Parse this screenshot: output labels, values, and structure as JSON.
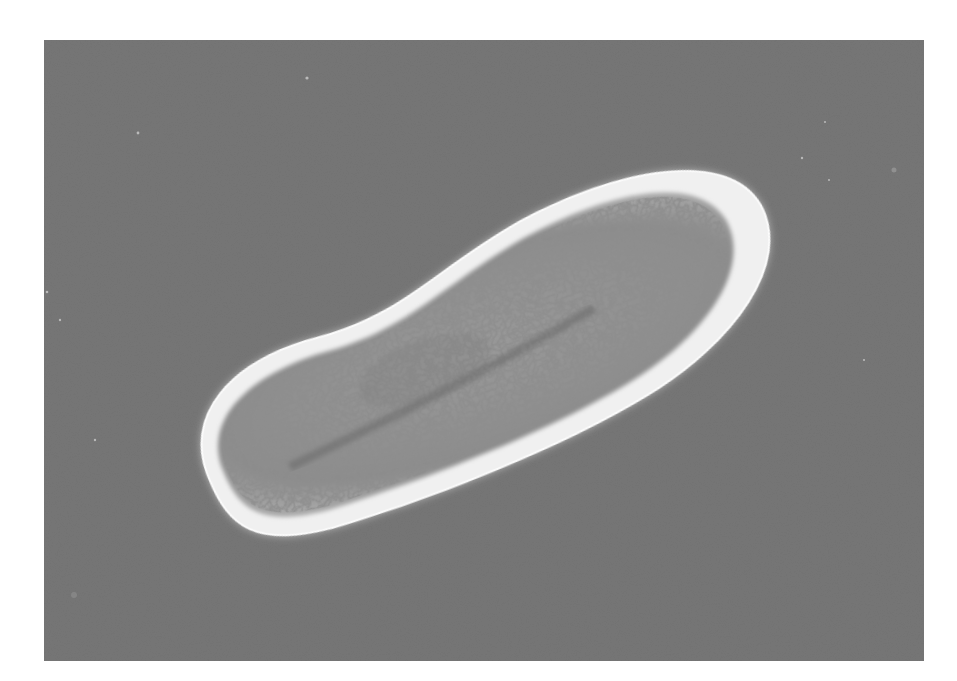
{
  "image": {
    "subject": "single-celled ciliate organism (paramecium-like) in phase-contrast micrograph",
    "background_color": "#767676",
    "page_color": "#ffffff",
    "halo_color": "#f2f2f2",
    "cytoplasm_color": "#8f8f8f",
    "granule_color": "#4a4a4a",
    "frame": {
      "x": 44,
      "y": 40,
      "width": 880,
      "height": 621
    },
    "organism": {
      "center_x": 483,
      "center_y": 354,
      "length": 620,
      "width": 245,
      "rotation_deg": -20
    }
  }
}
